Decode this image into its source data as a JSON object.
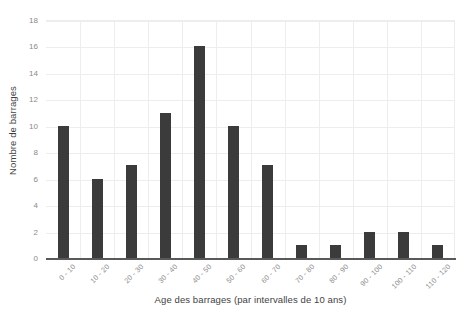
{
  "chart_data": {
    "type": "bar",
    "title": "",
    "subtitle": "",
    "xlabel": "Age des barrages (par intervalles de 10 ans)",
    "ylabel": "Nombre de barrages",
    "categories": [
      "0 - 10",
      "10 - 20",
      "20 - 30",
      "30 - 40",
      "40 - 50",
      "50 - 60",
      "60 - 70",
      "70 - 80",
      "80 - 90",
      "90 - 100",
      "100 - 110",
      "110 - 120"
    ],
    "values": [
      10,
      6,
      7,
      11,
      16,
      10,
      7,
      1,
      1,
      2,
      2,
      1
    ],
    "ylim": [
      0,
      18
    ],
    "ytick_labels": [
      "18",
      "16",
      "14",
      "12",
      "10",
      "8",
      "6",
      "4",
      "2",
      "0"
    ],
    "ytick_values": [
      18,
      16,
      14,
      12,
      10,
      8,
      6,
      4,
      2,
      0
    ],
    "grid": "both",
    "legend": "none",
    "bar_color": "#3b3b3b",
    "grid_color": "#ededed",
    "axis_color": "#595959",
    "tick_label_color": "#8a8a8a",
    "axis_title_color": "#3f3f3f",
    "background_color": "#ffffff",
    "xtick_rotation": -45
  }
}
